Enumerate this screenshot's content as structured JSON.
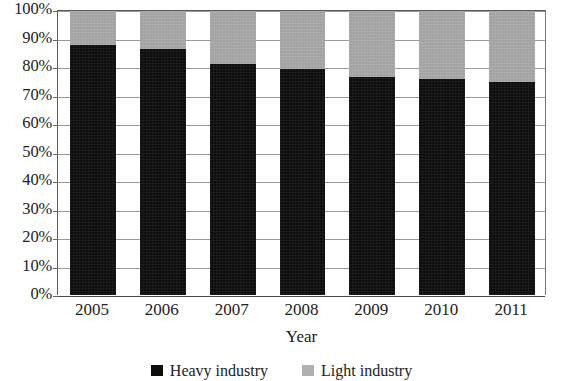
{
  "chart_data": {
    "type": "bar",
    "subtype": "stacked-100-percent",
    "title": "",
    "xlabel": "Year",
    "ylabel": "",
    "categories": [
      "2005",
      "2006",
      "2007",
      "2008",
      "2009",
      "2010",
      "2011"
    ],
    "series": [
      {
        "name": "Heavy industry",
        "color": "#0d0d0d",
        "values": [
          88,
          86.5,
          81.5,
          79.5,
          77,
          76,
          75
        ]
      },
      {
        "name": "Light industry",
        "color": "#a9a9a9",
        "values": [
          12,
          13.5,
          18.5,
          20.5,
          23,
          24,
          25
        ]
      }
    ],
    "ylim": [
      0,
      100
    ],
    "ytick_values": [
      0,
      10,
      20,
      30,
      40,
      50,
      60,
      70,
      80,
      90,
      100
    ],
    "ytick_labels": [
      "0%",
      "10%",
      "20%",
      "30%",
      "40%",
      "50%",
      "60%",
      "70%",
      "80%",
      "90%",
      "100%"
    ],
    "grid": true,
    "legend_position": "bottom"
  },
  "axes": {
    "x_title": "Year",
    "y_ticks": [
      "100%",
      "90%",
      "80%",
      "70%",
      "60%",
      "50%",
      "40%",
      "30%",
      "20%",
      "10%",
      "0%"
    ],
    "x_ticks": [
      "2005",
      "2006",
      "2007",
      "2008",
      "2009",
      "2010",
      "2011"
    ]
  },
  "legend": {
    "items": [
      {
        "label": "Heavy industry",
        "color": "#0d0d0d"
      },
      {
        "label": "Light industry",
        "color": "#b0b0b0"
      }
    ]
  }
}
